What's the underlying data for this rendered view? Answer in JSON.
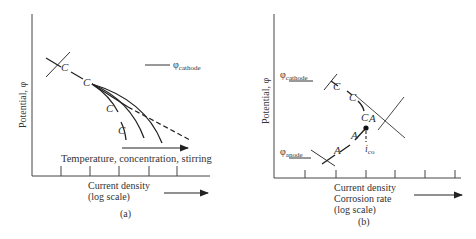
{
  "panel_a": {
    "caption": "(a)",
    "y_axis_label": "Potential, φ",
    "x_axis_label_line1": "Current density",
    "x_axis_label_line2": "(log scale)",
    "legend_symbol": "φ",
    "legend_subscript": "cathode",
    "arrow_label": "Temperature, concentration, stirring",
    "curve_labels": [
      "C",
      "C",
      "C",
      "C"
    ]
  },
  "panel_b": {
    "caption": "(b)",
    "y_axis_label": "Potential, φ",
    "x_axis_label_line1": "Current density",
    "x_axis_label_line2": "Corrosion rate",
    "x_axis_label_line3": "(log scale)",
    "cathode_symbol": "φ",
    "cathode_subscript": "cathode",
    "anode_symbol": "φ",
    "anode_subscript": "anode",
    "icorr_symbol": "i",
    "icorr_subscript": "co",
    "cathode_labels": [
      "C",
      "C",
      "C"
    ],
    "anode_labels": [
      "A",
      "A",
      "A"
    ]
  },
  "colors": {
    "line": "#222222",
    "text": "#333333",
    "background": "#ffffff"
  }
}
